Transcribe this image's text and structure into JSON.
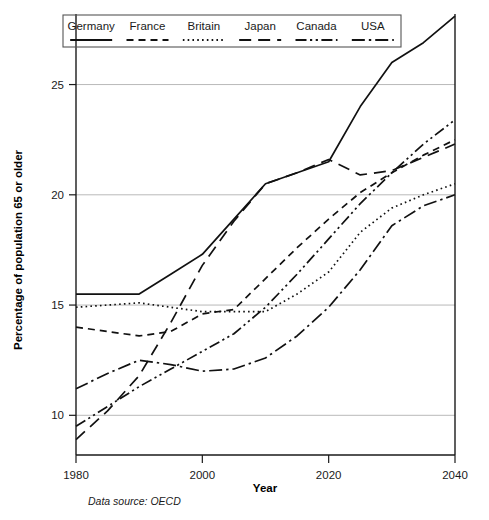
{
  "chart_data": {
    "type": "line",
    "title": "",
    "xlabel": "Year",
    "ylabel": "Percentage of population 65 or older",
    "source_note": "Data source: OECD",
    "xlim": [
      1980,
      2040
    ],
    "ylim": [
      8.2,
      28.2
    ],
    "xticks": [
      1980,
      2000,
      2020,
      2040
    ],
    "xtick_labels": [
      "1980",
      "2000",
      "2020",
      "2040"
    ],
    "yticks": [
      10,
      15,
      20,
      25
    ],
    "ytick_labels": [
      "10",
      "15",
      "20",
      "25"
    ],
    "grid": "horizontal",
    "legend_position": "top",
    "x": [
      1980,
      1985,
      1990,
      1995,
      2000,
      2005,
      2010,
      2015,
      2020,
      2025,
      2030,
      2035,
      2040
    ],
    "series": [
      {
        "name": "Germany",
        "dash": "solid",
        "values": [
          15.5,
          15.5,
          15.5,
          16.4,
          17.3,
          18.9,
          20.5,
          21.0,
          21.5,
          24.0,
          26.0,
          26.9,
          28.1
        ]
      },
      {
        "name": "France",
        "dash": "dashed",
        "values": [
          14.0,
          13.8,
          13.6,
          13.8,
          14.6,
          14.8,
          16.2,
          17.6,
          18.9,
          20.1,
          21.0,
          21.8,
          22.5
        ]
      },
      {
        "name": "Britain",
        "dash": "dotted",
        "values": [
          14.9,
          15.0,
          15.1,
          14.9,
          14.7,
          14.7,
          14.7,
          15.5,
          16.5,
          18.3,
          19.4,
          20.0,
          20.5
        ]
      },
      {
        "name": "Japan",
        "dash": "longdash",
        "values": [
          8.9,
          10.2,
          11.8,
          14.2,
          16.8,
          18.8,
          20.5,
          21.0,
          21.6,
          20.9,
          21.1,
          21.7,
          22.3
        ]
      },
      {
        "name": "Canada",
        "dash": "dashdotdot",
        "values": [
          9.5,
          10.4,
          11.3,
          12.1,
          12.9,
          13.7,
          14.9,
          16.4,
          18.0,
          19.6,
          21.0,
          22.3,
          23.4
        ]
      },
      {
        "name": "USA",
        "dash": "dashdot",
        "values": [
          11.2,
          11.9,
          12.5,
          12.3,
          12.0,
          12.1,
          12.6,
          13.6,
          14.9,
          16.6,
          18.6,
          19.5,
          20.0
        ]
      }
    ]
  },
  "legend": {
    "items": [
      {
        "label": "Germany",
        "dash": "solid"
      },
      {
        "label": "France",
        "dash": "dashed"
      },
      {
        "label": "Britain",
        "dash": "dotted"
      },
      {
        "label": "Japan",
        "dash": "longdash"
      },
      {
        "label": "Canada",
        "dash": "dashdotdot"
      },
      {
        "label": "USA",
        "dash": "dashdot"
      }
    ]
  }
}
